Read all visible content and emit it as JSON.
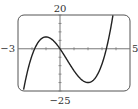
{
  "chart_data": {
    "type": "line",
    "title": "",
    "xlabel": "",
    "ylabel": "",
    "xlim": [
      -3,
      5
    ],
    "ylim": [
      -25,
      20
    ],
    "x_tick_step": 1,
    "y_tick_step": 5,
    "grid": false,
    "axis_labels": {
      "xmin": "−3",
      "xmax": "5",
      "ymax": "20",
      "ymin": "−25"
    },
    "function": "f(x) = 2x^3 - 3x^2 - 12x",
    "series": [
      {
        "name": "f(x)",
        "x": [
          -2.6,
          -2.4,
          -2.2,
          -2.0,
          -1.8,
          -1.6,
          -1.4,
          -1.2,
          -1.0,
          -0.8,
          -0.6,
          -0.4,
          -0.2,
          0.0,
          0.2,
          0.4,
          0.6,
          0.8,
          1.0,
          1.2,
          1.4,
          1.6,
          1.8,
          2.0,
          2.2,
          2.4,
          2.6,
          2.8,
          3.0,
          3.2,
          3.4,
          3.6,
          3.8,
          3.85
        ],
        "values": [
          -24.1,
          -15.7,
          -9.2,
          -4.0,
          0.0,
          3.1,
          5.3,
          6.7,
          7.0,
          6.7,
          5.8,
          4.3,
          2.3,
          0.0,
          -2.5,
          -5.2,
          -7.8,
          -10.5,
          -13.0,
          -15.3,
          -17.2,
          -18.7,
          -19.7,
          -20.0,
          -19.5,
          -18.1,
          -15.6,
          -11.9,
          -9.0,
          -2.3,
          1.5,
          7.5,
          13.4,
          19.9
        ]
      }
    ],
    "colors": {
      "curve": "#222222",
      "axes": "#777777",
      "frame": "#555555"
    }
  }
}
